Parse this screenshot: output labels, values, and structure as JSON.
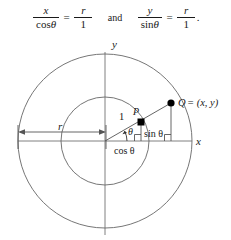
{
  "equations": {
    "first": {
      "numerator": "x",
      "denominator_fn": "cos",
      "denominator_arg": "θ",
      "equals": "=",
      "rhs_numerator": "r",
      "rhs_denominator": "1"
    },
    "conjunction": "and",
    "second": {
      "numerator": "y",
      "denominator_fn": "sin",
      "denominator_arg": "θ",
      "equals": "=",
      "rhs_numerator": "r",
      "rhs_denominator": "1",
      "trailing_punctuation": "."
    }
  },
  "diagram": {
    "axis_labels": {
      "x": "x",
      "y": "y"
    },
    "points": {
      "P": "P",
      "Q": "Q",
      "Q_coordinates": "= (x, y)"
    },
    "segment_labels": {
      "unit_hypotenuse": "1",
      "radius": "r",
      "opposite": "sin θ",
      "adjacent": "cos θ",
      "angle": "θ"
    },
    "colors": {
      "stroke": "#555555",
      "axis": "#777777",
      "text": "#1a1a1a",
      "point_fill": "#000000",
      "background": "#ffffff"
    },
    "geometry": {
      "origin_x": 105,
      "origin_y": 111,
      "unit_radius": 44,
      "outer_radius": 87,
      "angle_degrees": 27,
      "P_x": 141,
      "P_y": 92,
      "Q_x": 171,
      "Q_y": 73
    }
  }
}
